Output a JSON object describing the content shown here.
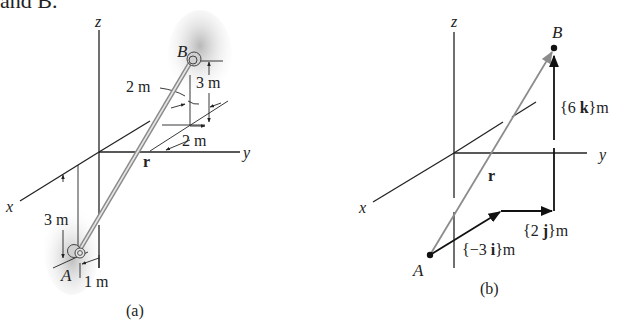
{
  "header_fragment": "and B.",
  "figure_a": {
    "caption": "(a)",
    "axes": {
      "x": "x",
      "y": "y",
      "z": "z"
    },
    "points": {
      "A": "A",
      "B": "B"
    },
    "vector_label": "r",
    "dims": {
      "b_offset_y": "2 m",
      "b_height": "3 m",
      "b_offset_x": "2 m",
      "a_depth": "3 m",
      "a_offset": "1 m"
    }
  },
  "figure_b": {
    "caption": "(b)",
    "axes": {
      "x": "x",
      "y": "y",
      "z": "z"
    },
    "points": {
      "A": "A",
      "B": "B"
    },
    "vector_label": "r",
    "components": {
      "i": "{−3 i}m",
      "j": "{2 j}m",
      "k": "{6 k}m"
    },
    "component_parts": {
      "i_pre": "{−3 ",
      "i_unit": "i",
      "i_post": "}m",
      "j_pre": "{2 ",
      "j_unit": "j",
      "j_post": "}m",
      "k_pre": "{6 ",
      "k_unit": "k",
      "k_post": "}m"
    }
  },
  "colors": {
    "axis": "#222222",
    "rod": "#9a9a9a",
    "shade": "#c8c8c8",
    "vector_r": "#8c8c8c",
    "component": "#111111"
  }
}
